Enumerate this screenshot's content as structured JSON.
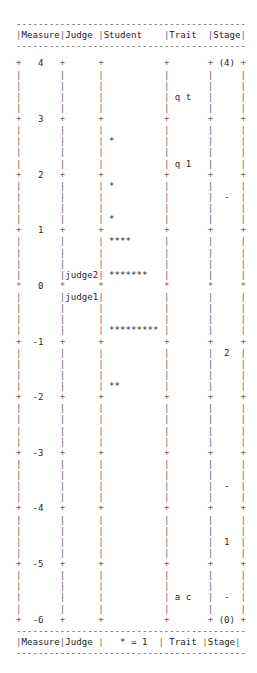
{
  "chart_data": {
    "type": "table",
    "columns": [
      "Measure",
      "Judge",
      "Student",
      "Trait",
      "Stage"
    ],
    "footer_columns": [
      "Measure",
      "Judge",
      "* = 1",
      "Trait",
      "Stage"
    ],
    "legend": "* = 1",
    "measure_range": [
      -6,
      4
    ],
    "measure_ticks": [
      4,
      3,
      2,
      1,
      0,
      -1,
      -2,
      -3,
      -4,
      -5,
      -6
    ],
    "lines_per_unit": 5,
    "judges": [
      {
        "label": "judge2",
        "measure": 0.2
      },
      {
        "label": "judge1",
        "measure": -0.2
      }
    ],
    "students": [
      {
        "measure": 2.6,
        "count": 1,
        "glyph": "*"
      },
      {
        "measure": 1.8,
        "count": 1,
        "glyph": "*"
      },
      {
        "measure": 1.2,
        "count": 1,
        "glyph": "*"
      },
      {
        "measure": 0.8,
        "count": 4,
        "glyph": "****"
      },
      {
        "measure": 0.2,
        "count": 7,
        "glyph": "*******"
      },
      {
        "measure": -0.8,
        "count": 9,
        "glyph": "*********"
      },
      {
        "measure": -1.8,
        "count": 2,
        "glyph": "**"
      }
    ],
    "traits": [
      {
        "label": "q t",
        "measure": 3.4
      },
      {
        "label": "q 1",
        "measure": 2.2
      },
      {
        "label": "a c",
        "measure": -5.6
      }
    ],
    "stage": [
      {
        "label": "(4)",
        "measure": 4
      },
      {
        "label": "-",
        "measure": 1.6
      },
      {
        "label": "2",
        "measure": -1.2
      },
      {
        "label": "-",
        "measure": -3.6
      },
      {
        "label": "1",
        "measure": -4.6
      },
      {
        "label": "-",
        "measure": -5.6
      },
      {
        "label": "(0)",
        "measure": -6
      }
    ]
  },
  "table": {
    "rule": "------------------------------------------",
    "header": {
      "measure": "Measure",
      "judge": "Judge",
      "student": "Student",
      "trait": "Trait",
      "stage": "Stage"
    },
    "footer": {
      "measure": "Measure",
      "judge": "Judge",
      "student": "   * = 1",
      "trait": " Trait",
      "stage": "Stage"
    },
    "rows": [
      {
        "sep": "+",
        "measure": "   4   ",
        "judge": "      ",
        "student": "           ",
        "trait": "       ",
        "stage": " (4) "
      },
      {
        "sep": "|",
        "measure": "       ",
        "judge": "      ",
        "student": "           ",
        "trait": "       ",
        "stage": "     "
      },
      {
        "sep": "|",
        "measure": "       ",
        "judge": "      ",
        "student": "           ",
        "trait": "       ",
        "stage": "     "
      },
      {
        "sep": "|",
        "measure": "       ",
        "judge": "      ",
        "student": "           ",
        "trait": " q t   ",
        "stage": "     "
      },
      {
        "sep": "|",
        "measure": "       ",
        "judge": "      ",
        "student": "           ",
        "trait": "       ",
        "stage": "     "
      },
      {
        "sep": "+",
        "measure": "   3   ",
        "judge": "      ",
        "student": "           ",
        "trait": "       ",
        "stage": "     "
      },
      {
        "sep": "|",
        "measure": "       ",
        "judge": "      ",
        "student": "           ",
        "trait": "       ",
        "stage": "     "
      },
      {
        "sep": "|",
        "measure": "       ",
        "judge": "      ",
        "student": " *         ",
        "trait": "       ",
        "stage": "     "
      },
      {
        "sep": "|",
        "measure": "       ",
        "judge": "      ",
        "student": "           ",
        "trait": "       ",
        "stage": "     "
      },
      {
        "sep": "|",
        "measure": "       ",
        "judge": "      ",
        "student": "           ",
        "trait": " q 1   ",
        "stage": "     "
      },
      {
        "sep": "+",
        "measure": "   2   ",
        "judge": "      ",
        "student": "           ",
        "trait": "       ",
        "stage": "     "
      },
      {
        "sep": "|",
        "measure": "       ",
        "judge": "      ",
        "student": " *         ",
        "trait": "       ",
        "stage": "     "
      },
      {
        "sep": "|",
        "measure": "       ",
        "judge": "      ",
        "student": "           ",
        "trait": "       ",
        "stage": "  -  "
      },
      {
        "sep": "|",
        "measure": "       ",
        "judge": "      ",
        "student": "           ",
        "trait": "       ",
        "stage": "     "
      },
      {
        "sep": "|",
        "measure": "       ",
        "judge": "      ",
        "student": " *         ",
        "trait": "       ",
        "stage": "     "
      },
      {
        "sep": "+",
        "measure": "   1   ",
        "judge": "      ",
        "student": "           ",
        "trait": "       ",
        "stage": "     "
      },
      {
        "sep": "|",
        "measure": "       ",
        "judge": "      ",
        "student": " ****      ",
        "trait": "       ",
        "stage": "     "
      },
      {
        "sep": "|",
        "measure": "       ",
        "judge": "      ",
        "student": "           ",
        "trait": "       ",
        "stage": "     "
      },
      {
        "sep": "|",
        "measure": "       ",
        "judge": "      ",
        "student": "           ",
        "trait": "       ",
        "stage": "     "
      },
      {
        "sep": "|",
        "measure": "       ",
        "judge": "judge2",
        "student": " *******   ",
        "trait": "       ",
        "stage": "     "
      },
      {
        "sep": "*",
        "measure": "   0   ",
        "judge": "      ",
        "student": "           ",
        "trait": "       ",
        "stage": "     "
      },
      {
        "sep": "|",
        "measure": "       ",
        "judge": "judge1",
        "student": "           ",
        "trait": "       ",
        "stage": "     "
      },
      {
        "sep": "|",
        "measure": "       ",
        "judge": "      ",
        "student": "           ",
        "trait": "       ",
        "stage": "     "
      },
      {
        "sep": "|",
        "measure": "       ",
        "judge": "      ",
        "student": "           ",
        "trait": "       ",
        "stage": "     "
      },
      {
        "sep": "|",
        "measure": "       ",
        "judge": "      ",
        "student": " ********* ",
        "trait": "       ",
        "stage": "     "
      },
      {
        "sep": "+",
        "measure": "  -1   ",
        "judge": "      ",
        "student": "           ",
        "trait": "       ",
        "stage": "     "
      },
      {
        "sep": "|",
        "measure": "       ",
        "judge": "      ",
        "student": "           ",
        "trait": "       ",
        "stage": "  2  "
      },
      {
        "sep": "|",
        "measure": "       ",
        "judge": "      ",
        "student": "           ",
        "trait": "       ",
        "stage": "     "
      },
      {
        "sep": "|",
        "measure": "       ",
        "judge": "      ",
        "student": "           ",
        "trait": "       ",
        "stage": "     "
      },
      {
        "sep": "|",
        "measure": "       ",
        "judge": "      ",
        "student": " **        ",
        "trait": "       ",
        "stage": "     "
      },
      {
        "sep": "+",
        "measure": "  -2   ",
        "judge": "      ",
        "student": "           ",
        "trait": "       ",
        "stage": "     "
      },
      {
        "sep": "|",
        "measure": "       ",
        "judge": "      ",
        "student": "           ",
        "trait": "       ",
        "stage": "     "
      },
      {
        "sep": "|",
        "measure": "       ",
        "judge": "      ",
        "student": "           ",
        "trait": "       ",
        "stage": "     "
      },
      {
        "sep": "|",
        "measure": "       ",
        "judge": "      ",
        "student": "           ",
        "trait": "       ",
        "stage": "     "
      },
      {
        "sep": "|",
        "measure": "       ",
        "judge": "      ",
        "student": "           ",
        "trait": "       ",
        "stage": "     "
      },
      {
        "sep": "+",
        "measure": "  -3   ",
        "judge": "      ",
        "student": "           ",
        "trait": "       ",
        "stage": "     "
      },
      {
        "sep": "|",
        "measure": "       ",
        "judge": "      ",
        "student": "           ",
        "trait": "       ",
        "stage": "     "
      },
      {
        "sep": "|",
        "measure": "       ",
        "judge": "      ",
        "student": "           ",
        "trait": "       ",
        "stage": "     "
      },
      {
        "sep": "|",
        "measure": "       ",
        "judge": "      ",
        "student": "           ",
        "trait": "       ",
        "stage": "  -  "
      },
      {
        "sep": "|",
        "measure": "       ",
        "judge": "      ",
        "student": "           ",
        "trait": "       ",
        "stage": "     "
      },
      {
        "sep": "+",
        "measure": "  -4   ",
        "judge": "      ",
        "student": "           ",
        "trait": "       ",
        "stage": "     "
      },
      {
        "sep": "|",
        "measure": "       ",
        "judge": "      ",
        "student": "           ",
        "trait": "       ",
        "stage": "     "
      },
      {
        "sep": "|",
        "measure": "       ",
        "judge": "      ",
        "student": "           ",
        "trait": "       ",
        "stage": "     "
      },
      {
        "sep": "|",
        "measure": "       ",
        "judge": "      ",
        "student": "           ",
        "trait": "       ",
        "stage": "  1  "
      },
      {
        "sep": "|",
        "measure": "       ",
        "judge": "      ",
        "student": "           ",
        "trait": "       ",
        "stage": "     "
      },
      {
        "sep": "+",
        "measure": "  -5   ",
        "judge": "      ",
        "student": "           ",
        "trait": "       ",
        "stage": "     "
      },
      {
        "sep": "|",
        "measure": "       ",
        "judge": "      ",
        "student": "           ",
        "trait": "       ",
        "stage": "     "
      },
      {
        "sep": "|",
        "measure": "       ",
        "judge": "      ",
        "student": "           ",
        "trait": "       ",
        "stage": "     "
      },
      {
        "sep": "|",
        "measure": "       ",
        "judge": "      ",
        "student": "           ",
        "trait": " a c   ",
        "stage": "  -  "
      },
      {
        "sep": "|",
        "measure": "       ",
        "judge": "      ",
        "student": "           ",
        "trait": "       ",
        "stage": "     "
      },
      {
        "sep": "+",
        "measure": "  -6   ",
        "judge": "      ",
        "student": "           ",
        "trait": "       ",
        "stage": " (0) "
      }
    ]
  }
}
